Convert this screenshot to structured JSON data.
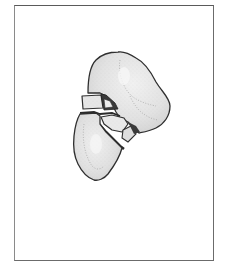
{
  "figure": {
    "colors": {
      "frame": "#6b6b6b",
      "outline": "#2e2e2e",
      "bone_fill": "#e4e4e4",
      "bone_shading": "#c9c9c9",
      "background": "#ffffff"
    },
    "fragments": [
      {
        "name": "upper-fragment"
      },
      {
        "name": "left-block-fragment"
      },
      {
        "name": "middle-small-fragment"
      },
      {
        "name": "wedge-fragment"
      },
      {
        "name": "lower-fragment"
      }
    ]
  }
}
